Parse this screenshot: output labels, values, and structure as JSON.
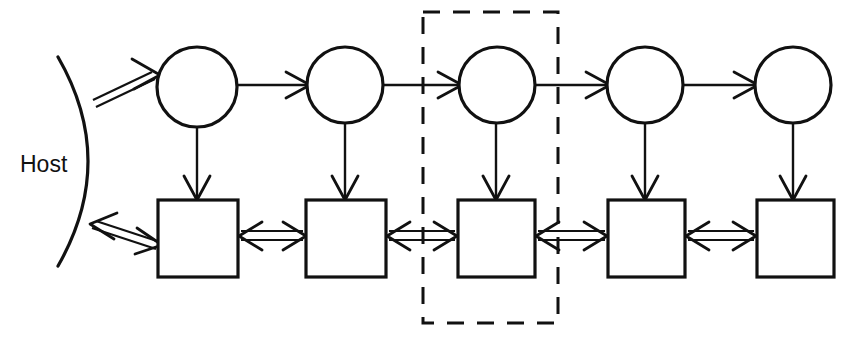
{
  "diagram": {
    "background_color": "#ffffff",
    "stroke_color": "#111111",
    "width": 855,
    "height": 338,
    "host": {
      "label": "Host",
      "label_x": 20,
      "label_y": 172,
      "arc": {
        "start_x": 58,
        "start_y": 57,
        "ctrl_x": 118,
        "ctrl_y": 161,
        "end_x": 58,
        "end_y": 266
      }
    },
    "circles": [
      {
        "id": "circle-1",
        "cx": 197,
        "cy": 87,
        "r": 40
      },
      {
        "id": "circle-2",
        "cx": 345,
        "cy": 85,
        "r": 38
      },
      {
        "id": "circle-3",
        "cx": 497,
        "cy": 85,
        "r": 38
      },
      {
        "id": "circle-4",
        "cx": 645,
        "cy": 85,
        "r": 38
      },
      {
        "id": "circle-5",
        "cx": 793,
        "cy": 85,
        "r": 38
      }
    ],
    "boxes": [
      {
        "id": "box-1",
        "x": 158,
        "y": 200,
        "w": 80,
        "h": 77
      },
      {
        "id": "box-2",
        "x": 306,
        "y": 200,
        "w": 80,
        "h": 77
      },
      {
        "id": "box-3",
        "x": 458,
        "y": 200,
        "w": 77,
        "h": 77
      },
      {
        "id": "box-4",
        "x": 608,
        "y": 200,
        "w": 77,
        "h": 77
      },
      {
        "id": "box-5",
        "x": 757,
        "y": 200,
        "w": 77,
        "h": 77
      }
    ],
    "highlight_region": {
      "id": "dashed-selection",
      "x": 423,
      "y": 12,
      "w": 135,
      "h": 311,
      "style": "dashed"
    },
    "edges": {
      "host_to_circle1": {
        "type": "double-line-arrow",
        "direction": "forward"
      },
      "host_to_box1": {
        "type": "double-line-arrow",
        "direction": "bidirectional"
      },
      "circle_to_circle": {
        "type": "single-line-arrow",
        "direction": "forward",
        "count": 4
      },
      "circle_to_box": {
        "type": "single-line-arrow",
        "direction": "down",
        "count": 5
      },
      "box_to_box": {
        "type": "double-line-arrow",
        "direction": "bidirectional",
        "count": 4
      }
    }
  }
}
